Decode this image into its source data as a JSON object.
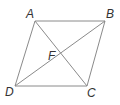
{
  "diagram": {
    "type": "parallelogram-with-diagonals",
    "line_color": "#8a8a8a",
    "label_color": "#333333",
    "vertices": {
      "A": {
        "x": 35,
        "y": 21,
        "label": "A",
        "label_x": 26,
        "label_y": 18
      },
      "B": {
        "x": 105,
        "y": 21,
        "label": "B",
        "label_x": 106,
        "label_y": 18
      },
      "C": {
        "x": 87,
        "y": 86,
        "label": "C",
        "label_x": 87,
        "label_y": 97
      },
      "D": {
        "x": 15,
        "y": 86,
        "label": "D",
        "label_x": 5,
        "label_y": 96
      }
    },
    "intersection": {
      "x": 61,
      "y": 54,
      "label": "F",
      "label_x": 48,
      "label_y": 60
    },
    "edges": [
      [
        "A",
        "B"
      ],
      [
        "B",
        "C"
      ],
      [
        "C",
        "D"
      ],
      [
        "D",
        "A"
      ]
    ],
    "diagonals": [
      [
        "A",
        "C"
      ],
      [
        "B",
        "D"
      ]
    ]
  }
}
